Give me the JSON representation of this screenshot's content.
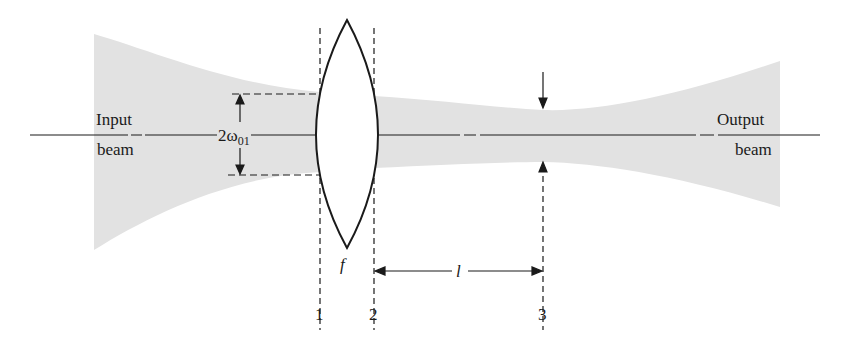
{
  "diagram": {
    "labels": {
      "input_line1": "Input",
      "input_line2": "beam",
      "output_line1": "Output",
      "output_line2": "beam",
      "waist_symbol_prefix": "2ω",
      "waist_symbol_subscript": "01",
      "focal_length": "f",
      "distance": "l",
      "plane_1": "1",
      "plane_2": "2",
      "plane_3": "3"
    },
    "colors": {
      "beam_fill": "#e2e2e2",
      "line": "#1a1a1a",
      "background": "#ffffff"
    },
    "elements": [
      "input beam (shaded, converging)",
      "optical axis",
      "biconvex lens with focal length f",
      "reference planes 1, 2, 3 (dashed)",
      "input waist dimension 2ω01",
      "output waist marker arrows at plane 3",
      "distance l from plane 2 to plane 3",
      "output beam (shaded, diverging)"
    ]
  }
}
